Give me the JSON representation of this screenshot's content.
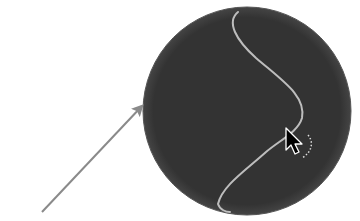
{
  "figure": {
    "disc": {
      "cx": 247,
      "cy": 111,
      "r": 104,
      "fill": "#333333",
      "edge": "#555555"
    },
    "curve": {
      "color": "#bdbdbd",
      "path": "M 238 12 C 226 22, 236 40, 256 58 C 284 82, 306 96, 302 118 C 298 132, 280 140, 266 152 C 246 170, 222 186, 218 204 C 220 210, 226 212, 230 212"
    },
    "pointer": {
      "color": "#000000",
      "outline": "#ffffff",
      "x": 286,
      "y": 128
    },
    "pointer_trail": {
      "color": "#dddddd"
    },
    "annotation_arrow": {
      "color": "#8a8a8a",
      "x1": 42,
      "y1": 212,
      "x2": 142,
      "y2": 106
    }
  }
}
